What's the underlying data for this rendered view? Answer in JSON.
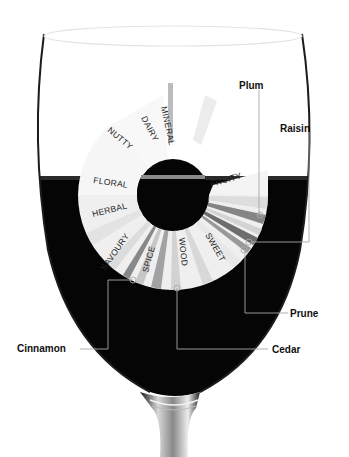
{
  "diagram": {
    "wheel_categories": [
      {
        "label": "MINERAL",
        "angle": -100
      },
      {
        "label": "DAIRY",
        "angle": -118
      },
      {
        "label": "NUTTY",
        "angle": -138
      },
      {
        "label": "FLORAL",
        "angle": -172
      },
      {
        "label": "FRUITY",
        "angle": -12
      },
      {
        "label": "HERBAL",
        "angle": 165
      },
      {
        "label": "SAVOURY",
        "angle": 128
      },
      {
        "label": "SPICE",
        "angle": 104
      },
      {
        "label": "WOOD",
        "angle": 84
      },
      {
        "label": "SWEET",
        "angle": 58
      }
    ],
    "callouts": [
      {
        "label": "Plum",
        "x": 239,
        "y": 80,
        "anchor_x": 260,
        "anchor_y": 215
      },
      {
        "label": "Raisin",
        "x": 280,
        "y": 123,
        "anchor_x": 249,
        "anchor_y": 242
      },
      {
        "label": "Prune",
        "x": 290,
        "y": 308,
        "anchor_x": 244,
        "anchor_y": 250
      },
      {
        "label": "Cedar",
        "x": 272,
        "y": 344,
        "anchor_x": 177,
        "anchor_y": 288
      },
      {
        "label": "Cinnamon",
        "x": 17,
        "y": 343,
        "anchor_x": 133,
        "anchor_y": 280
      }
    ],
    "colors": {
      "wine": "#050505",
      "glass_outline": "#222222",
      "wheel_light": "#f2f2f2",
      "wheel_mid": "#bdbdbd",
      "wheel_dark": "#6e6e6e",
      "leader_line": "#aaaaaa"
    }
  }
}
